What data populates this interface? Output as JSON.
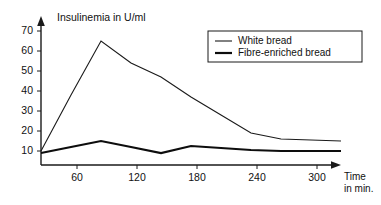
{
  "chart_data": {
    "type": "line",
    "title": "",
    "ylabel": "Insulinemia in U/ml",
    "xlabel": "Time in min.",
    "xlabel_line1": "Time",
    "xlabel_line2": "in min.",
    "xlim": [
      0,
      315
    ],
    "ylim": [
      0,
      75
    ],
    "grid": false,
    "legend_position": "upper right",
    "xticks": [
      60,
      120,
      180,
      240,
      300
    ],
    "xticklabels": [
      "60",
      "120",
      "180",
      "240",
      "300"
    ],
    "yticks": [
      10,
      20,
      30,
      40,
      50,
      60,
      70
    ],
    "yticklabels": [
      "10",
      "20",
      "30",
      "40",
      "50",
      "60",
      "70"
    ],
    "x": [
      0,
      30,
      60,
      90,
      120,
      150,
      180,
      210,
      240,
      270,
      300
    ],
    "series": [
      {
        "name": "White bread",
        "style": "thin",
        "values": [
          10,
          38,
          65,
          54,
          47,
          37,
          28,
          19,
          16,
          15.5,
          15
        ]
      },
      {
        "name": "Fibre-enriched bread",
        "style": "thick",
        "values": [
          9,
          12,
          15,
          12,
          9,
          12.5,
          11.5,
          10.5,
          10,
          10,
          10
        ]
      }
    ],
    "legend_entries": [
      {
        "label": "White bread",
        "style": "thin"
      },
      {
        "label": "Fibre-enriched bread",
        "style": "thick"
      }
    ]
  }
}
